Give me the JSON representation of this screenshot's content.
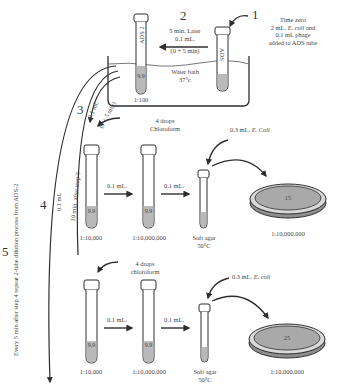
{
  "steps": {
    "s1": {
      "number": "1",
      "line1": "Time zero",
      "line2_pre": "2 mL. ",
      "line2_italic": "E. coli",
      "line2_post": " and",
      "line3": "0.1 mL phage",
      "line4": "added to ADS tube"
    },
    "s2": {
      "number": "2",
      "line1": "5 min. Later",
      "line2": "0.1 mL.",
      "line3": "(0 + 5 min)"
    },
    "s3": {
      "number": "3",
      "volume": "0.1 mL",
      "time": "(0 + 5 min)"
    },
    "s4": {
      "number": "4",
      "volume": "0.1 mL",
      "time": "10 min. after step 3"
    },
    "s5": {
      "number": "5",
      "text": "Every 5 min after step 4 repeat 2-tube dilution process from ADS-2"
    }
  },
  "water_bath": {
    "line1": "Water bath",
    "line2": "37°c"
  },
  "tubes": {
    "ads": {
      "label": "ADS"
    },
    "ads2": {
      "label": "ADS 2",
      "volume": "9.9",
      "dilution": "1:100"
    }
  },
  "rows": [
    {
      "chloroform_line1": "4 drops",
      "chloroform_line2": "Chloroform",
      "ecoli_pre": "0.3 mL. ",
      "ecoli_italic": "E. Coli",
      "tube1": {
        "volume": "9.9",
        "dilution": "1:10,000"
      },
      "tube2": {
        "volume": "9.9",
        "dilution": "1:10,000,000"
      },
      "transfer1": "0.1 mL.",
      "transfer2": "0.1 mL.",
      "soft_agar_line1": "Soft agar",
      "soft_agar_line2": "50°C",
      "plate": {
        "count": "15",
        "dilution": "1:10,000,000"
      }
    },
    {
      "chloroform_line1": "4 drops",
      "chloroform_line2": "chloroform",
      "ecoli_pre": "0.3 mL. ",
      "ecoli_italic": "E. coli",
      "tube1": {
        "volume": "9.9",
        "dilution": "1:10,000"
      },
      "tube2": {
        "volume": "9.9",
        "dilution": "1:10,000,000"
      },
      "transfer1": "0.1 mL.",
      "transfer2": "0.1 mL.",
      "soft_agar_line1": "Soft agar",
      "soft_agar_line2": "50°C",
      "plate": {
        "count": "25",
        "dilution": "1:10,000,000"
      }
    }
  ],
  "colors": {
    "liquid": "#b9b9b9",
    "stroke": "#2e2e2e",
    "plate_fill": "#a9a9a9",
    "plate_rim": "#d9d9d9"
  }
}
